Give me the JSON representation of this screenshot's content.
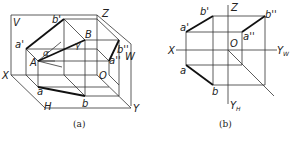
{
  "figure_a": {
    "caption": "(a)",
    "labels": {
      "V": "V",
      "H": "H",
      "W": "W",
      "X": "X",
      "Y": "Y",
      "Z": "Z",
      "O": "O",
      "A": "A",
      "B": "B",
      "a_prime": "a'",
      "b_prime": "b'",
      "a_double": "a''",
      "b_double": "b''",
      "a": "a",
      "b": "b",
      "alpha": "α",
      "gamma": "γ",
      "beta": "β"
    }
  },
  "figure_b": {
    "caption": "(b)",
    "labels": {
      "X": "X",
      "Z": "Z",
      "O": "O",
      "Y_W": "Y",
      "Y_W_sub": "W",
      "Y_H": "Y",
      "Y_H_sub": "H",
      "a_prime": "a'",
      "b_prime": "b'",
      "a_double": "a''",
      "b_double": "b''",
      "a": "a",
      "b": "b"
    }
  }
}
